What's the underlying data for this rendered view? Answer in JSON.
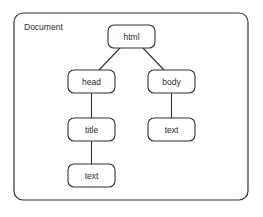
{
  "canvas": {
    "width": 263,
    "height": 217,
    "background": "#ffffff",
    "stroke_color": "#333333",
    "text_color": "#2b2b2b"
  },
  "container": {
    "label": "Document",
    "x": 14,
    "y": 13,
    "width": 234,
    "height": 187,
    "corner_radius": 9,
    "label_x": 24,
    "label_y": 27
  },
  "diagram": {
    "type": "tree",
    "title": "Document",
    "node_width": 47,
    "node_height": 23,
    "node_corner_radius": 6,
    "nodes": [
      {
        "id": "html",
        "label": "html",
        "x": 108,
        "y": 25,
        "cx": 131.5,
        "cy": 36.5
      },
      {
        "id": "head",
        "label": "head",
        "x": 68,
        "y": 70,
        "cx": 91.5,
        "cy": 81.5
      },
      {
        "id": "body",
        "label": "body",
        "x": 148,
        "y": 70,
        "cx": 171.5,
        "cy": 81.5
      },
      {
        "id": "title",
        "label": "title",
        "x": 68,
        "y": 118,
        "cx": 91.5,
        "cy": 129.5
      },
      {
        "id": "body-text",
        "label": "text",
        "x": 148,
        "y": 118,
        "cx": 171.5,
        "cy": 129.5
      },
      {
        "id": "title-text",
        "label": "text",
        "x": 68,
        "y": 164,
        "cx": 91.5,
        "cy": 175.5
      }
    ],
    "edges": [
      {
        "id": "html-head",
        "from": "html",
        "to": "head",
        "kind": "diagonal",
        "x1": 120,
        "y1": 48,
        "x2": 99,
        "y2": 70
      },
      {
        "id": "html-body",
        "from": "html",
        "to": "body",
        "kind": "diagonal",
        "x1": 143,
        "y1": 48,
        "x2": 164,
        "y2": 70
      },
      {
        "id": "head-title",
        "from": "head",
        "to": "title",
        "kind": "vertical",
        "x1": 91.5,
        "y1": 93,
        "x2": 91.5,
        "y2": 118
      },
      {
        "id": "body-text",
        "from": "body",
        "to": "body-text",
        "kind": "vertical",
        "x1": 171.5,
        "y1": 93,
        "x2": 171.5,
        "y2": 118
      },
      {
        "id": "title-text",
        "from": "title",
        "to": "title-text",
        "kind": "vertical",
        "x1": 91.5,
        "y1": 141,
        "x2": 91.5,
        "y2": 164
      }
    ]
  }
}
